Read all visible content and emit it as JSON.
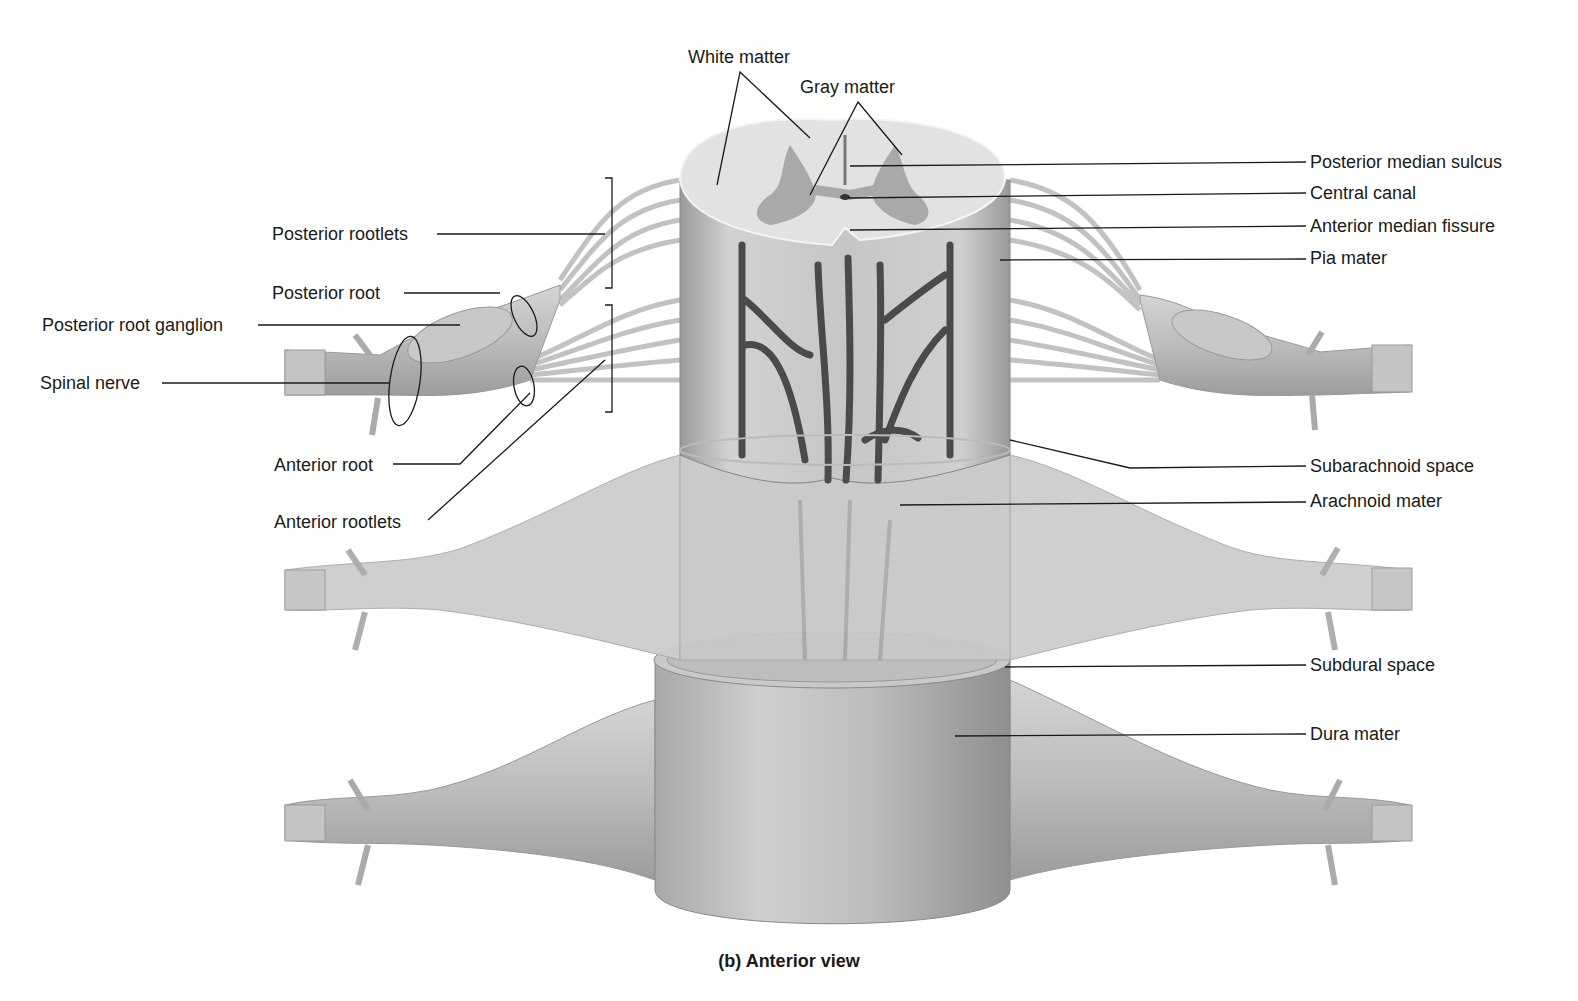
{
  "figure": {
    "caption": "(b) Anterior view",
    "colors": {
      "background": "#ffffff",
      "tissue_light": "#d9d9d9",
      "tissue_mid": "#b8b8b8",
      "tissue_dark": "#8c8c8c",
      "gray_matter": "#a6a6a6",
      "white_matter": "#dedede",
      "vessel": "#4a4a4a",
      "leader_line": "#1a1a1a"
    }
  },
  "labels": {
    "top": [
      {
        "id": "white-matter",
        "text": "White matter"
      },
      {
        "id": "gray-matter",
        "text": "Gray matter"
      }
    ],
    "left": [
      {
        "id": "posterior-rootlets",
        "text": "Posterior rootlets"
      },
      {
        "id": "posterior-root",
        "text": "Posterior root"
      },
      {
        "id": "posterior-root-ganglion",
        "text": "Posterior root ganglion"
      },
      {
        "id": "spinal-nerve",
        "text": "Spinal nerve"
      },
      {
        "id": "anterior-root",
        "text": "Anterior root"
      },
      {
        "id": "anterior-rootlets",
        "text": "Anterior rootlets"
      }
    ],
    "right": [
      {
        "id": "posterior-median-sulcus",
        "text": "Posterior median sulcus"
      },
      {
        "id": "central-canal",
        "text": "Central canal"
      },
      {
        "id": "anterior-median-fissure",
        "text": "Anterior median fissure"
      },
      {
        "id": "pia-mater",
        "text": "Pia mater"
      },
      {
        "id": "subarachnoid-space",
        "text": "Subarachnoid space"
      },
      {
        "id": "arachnoid-mater",
        "text": "Arachnoid mater"
      },
      {
        "id": "subdural-space",
        "text": "Subdural space"
      },
      {
        "id": "dura-mater",
        "text": "Dura mater"
      }
    ]
  }
}
